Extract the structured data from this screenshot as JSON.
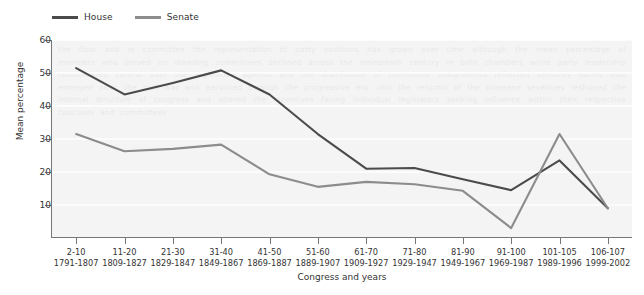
{
  "chart_data": {
    "type": "line",
    "title": "",
    "xlabel": "Congress and years",
    "ylabel": "Mean percentage",
    "ylim": [
      0,
      60
    ],
    "yticks": [
      10,
      20,
      30,
      40,
      50,
      60
    ],
    "grid": true,
    "legend_position": "top-left",
    "categories": [
      "2-10",
      "11-20",
      "21-30",
      "31-40",
      "41-50",
      "51-60",
      "61-70",
      "71-80",
      "81-90",
      "91-100",
      "101-105",
      "106-107"
    ],
    "category_years": [
      "1791-1807",
      "1809-1827",
      "1829-1847",
      "1849-1867",
      "1869-1887",
      "1889-1907",
      "1909-1927",
      "1929-1947",
      "1949-1967",
      "1969-1987",
      "1989-1996",
      "1999-2002"
    ],
    "series": [
      {
        "name": "House",
        "color": "#4b4b4b",
        "values": [
          51.5,
          43.5,
          47.0,
          50.8,
          43.5,
          31.5,
          21.0,
          21.2,
          17.8,
          14.5,
          23.5,
          9.0
        ]
      },
      {
        "name": "Senate",
        "color": "#8c8c8c",
        "values": [
          31.5,
          26.3,
          27.0,
          28.3,
          19.3,
          15.5,
          17.0,
          16.3,
          14.3,
          3.0,
          31.5,
          9.0
        ]
      }
    ]
  },
  "legend": {
    "entries": [
      {
        "label": "House"
      },
      {
        "label": "Senate"
      }
    ]
  },
  "axes": {
    "y_title": "Mean percentage",
    "x_title": "Congress and years"
  },
  "colors": {
    "house": "#4b4b4b",
    "senate": "#8c8c8c",
    "plot_background": "#f4f4f4",
    "gridline": "#ffffff",
    "axis": "#777777",
    "text": "#333333"
  },
  "watermark": {
    "text": "the floor and in committee the representation of party positions has grown over time although the mean percentage of members who served on standing committees declined across the nineteenth century in both chambers while party leadership consolidated control over the legislative agenda and the distribution of committee assignments reflected seniority norms that emerged after the civil war and persisted through the progressive era until the reforms of the nineteen seventies reshaped the internal structure of congress and altered the incentives facing individual legislators seeking influence within their respective caucuses and committees"
  }
}
